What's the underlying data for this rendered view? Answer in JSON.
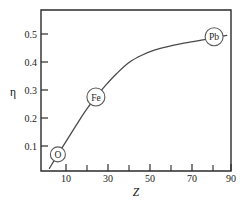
{
  "figure": {
    "name": "eta-vs-atomic-number-plot",
    "background": "#ffffff",
    "axis_color": "#2b2b2b",
    "curve_color": "#4a4a4a",
    "marker_fill": "#ffffff",
    "marker_stroke": "#5a5a5a"
  },
  "chart_data": {
    "type": "line",
    "title": "",
    "xlabel": "Z",
    "ylabel": "η",
    "xlim": [
      0,
      90
    ],
    "ylim": [
      0.0,
      0.55
    ],
    "grid": false,
    "legend": null,
    "x_ticks": [
      10,
      30,
      50,
      70,
      90
    ],
    "x_tick_labels": [
      "10",
      "30",
      "50",
      "70",
      "90"
    ],
    "x_minor_ticks": [
      20,
      40,
      60,
      80
    ],
    "y_ticks": [
      0.1,
      0.2,
      0.3,
      0.4,
      0.5
    ],
    "y_tick_labels": [
      "0.1",
      "0.2",
      "0.3",
      "0.4",
      "0.5"
    ],
    "series": [
      {
        "name": "eta",
        "x": [
          4,
          8,
          13,
          18,
          22,
          26,
          31,
          36,
          42,
          48,
          54,
          60,
          66,
          72,
          78,
          82,
          88
        ],
        "y": [
          0.02,
          0.07,
          0.13,
          0.19,
          0.235,
          0.275,
          0.32,
          0.36,
          0.4,
          0.425,
          0.443,
          0.455,
          0.465,
          0.473,
          0.481,
          0.487,
          0.495
        ]
      }
    ],
    "annotations": [
      {
        "label": "O",
        "x": 8,
        "y": 0.07
      },
      {
        "label": "Fe",
        "x": 26,
        "y": 0.275
      },
      {
        "label": "Pb",
        "x": 82,
        "y": 0.49
      }
    ]
  }
}
